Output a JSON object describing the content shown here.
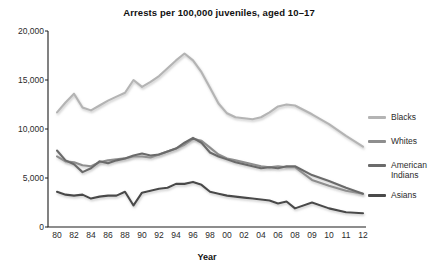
{
  "chart_data": {
    "type": "line",
    "title": "Arrests per 100,000 juveniles, aged 10–17",
    "xlabel": "Year",
    "ylabel": "",
    "ylim": [
      0,
      20000
    ],
    "grid": false,
    "legend_position": "right",
    "ytick_labels": [
      "0",
      "5,000",
      "10,000",
      "15,000",
      "20,000"
    ],
    "ytick_values": [
      0,
      5000,
      10000,
      15000,
      20000
    ],
    "categories": [
      "80",
      "81",
      "82",
      "83",
      "84",
      "85",
      "86",
      "87",
      "88",
      "89",
      "90",
      "91",
      "92",
      "93",
      "94",
      "95",
      "96",
      "97",
      "98",
      "99",
      "00",
      "01",
      "02",
      "03",
      "04",
      "05",
      "06",
      "07",
      "08",
      "09",
      "10",
      "11",
      "12"
    ],
    "xtick_labels": [
      "80",
      "82",
      "84",
      "86",
      "88",
      "90",
      "92",
      "94",
      "96",
      "98",
      "00",
      "02",
      "04",
      "06",
      "08",
      "09",
      "10",
      "11",
      "12"
    ],
    "series": [
      {
        "name": "Blacks",
        "color": "#b4b4b4",
        "values": [
          11700,
          12700,
          13600,
          12200,
          11900,
          12400,
          12900,
          13300,
          13700,
          15000,
          14300,
          14800,
          15400,
          16200,
          17000,
          17700,
          17000,
          15800,
          14200,
          12600,
          11600,
          11200,
          11100,
          11000,
          11200,
          11700,
          12300,
          12500,
          12400,
          11500,
          10500,
          9300,
          8200
        ]
      },
      {
        "name": "Whites",
        "color": "#8e8e8e",
        "values": [
          7200,
          6700,
          6600,
          6300,
          6200,
          6600,
          6800,
          6900,
          7000,
          7200,
          7200,
          7100,
          7400,
          7700,
          8000,
          8400,
          9000,
          8800,
          8100,
          7400,
          7000,
          6800,
          6600,
          6400,
          6200,
          6100,
          6200,
          6100,
          6100,
          4800,
          4200,
          3700,
          3400
        ]
      },
      {
        "name": "American\nIndians",
        "color": "#6b6b6b",
        "values": [
          7800,
          6800,
          6400,
          5600,
          6000,
          6700,
          6500,
          6800,
          7000,
          7300,
          7500,
          7300,
          7400,
          7700,
          8000,
          8600,
          9100,
          8600,
          7600,
          7200,
          6900,
          6600,
          6400,
          6200,
          6000,
          6100,
          6000,
          6200,
          6200,
          5300,
          4700,
          4000,
          3400
        ]
      },
      {
        "name": "Asians",
        "color": "#4a4a4a",
        "values": [
          3600,
          3300,
          3200,
          3300,
          2900,
          3100,
          3200,
          3200,
          3600,
          2200,
          3500,
          3700,
          3900,
          4000,
          4400,
          4400,
          4600,
          4300,
          3600,
          3400,
          3200,
          3100,
          3000,
          2900,
          2800,
          2700,
          2400,
          2600,
          1900,
          2500,
          1900,
          1500,
          1400
        ]
      }
    ]
  }
}
